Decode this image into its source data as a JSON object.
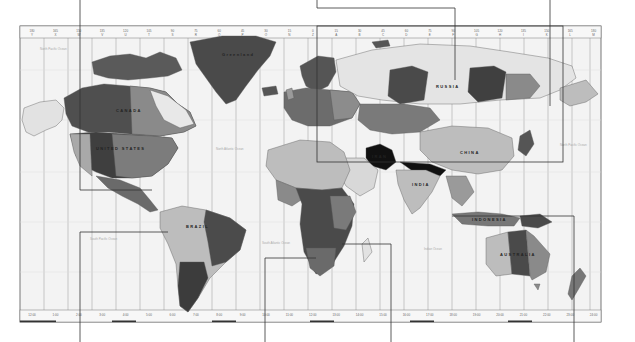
{
  "figure": {
    "colors": {
      "background": "#ffffff",
      "ocean": "#f3f3f3",
      "zone_line": "#9a9a9a",
      "frame": "#555555",
      "callout_line": "#333333",
      "land_dark": "#4a4a4a",
      "land_mid": "#8a8a8a",
      "land_light": "#bdbdbd",
      "land_pale": "#e2e2e2",
      "highlight": "#111111"
    },
    "top_ruler": {
      "longitudes": [
        "180",
        "165",
        "150",
        "135",
        "120",
        "105",
        "90",
        "75",
        "60",
        "45",
        "30",
        "15",
        "0",
        "15",
        "30",
        "45",
        "60",
        "75",
        "90",
        "105",
        "120",
        "135",
        "150",
        "165",
        "180"
      ],
      "zone_letters": [
        "Y",
        "X",
        "W",
        "V",
        "U",
        "T",
        "S",
        "R",
        "Q",
        "P",
        "O",
        "N",
        "Z",
        "A",
        "B",
        "C",
        "D",
        "E",
        "F",
        "G",
        "H",
        "I",
        "K",
        "L",
        "M"
      ]
    },
    "bottom_ruler": {
      "times": [
        "12:00",
        "1:00",
        "2:00",
        "3:00",
        "4:00",
        "5:00",
        "6:00",
        "7:00",
        "8:00",
        "9:00",
        "10:00",
        "11:00",
        "12:00",
        "13:00",
        "14:00",
        "15:00",
        "16:00",
        "17:00",
        "18:00",
        "19:00",
        "20:00",
        "21:00",
        "22:00",
        "23:00",
        "24:00"
      ]
    },
    "country_labels": {
      "greenland": "Greenland",
      "canada": "CANADA",
      "united_states": "UNITED STATES",
      "brazil": "BRAZIL",
      "russia": "RUSSIA",
      "china": "CHINA",
      "india": "INDIA",
      "iran": "IRAN",
      "australia": "AUSTRALIA",
      "indonesia": "INDONESIA"
    },
    "ocean_labels": {
      "north_pacific_w": "North Pacific Ocean",
      "north_atlantic": "North Atlantic Ocean",
      "south_pacific": "South Pacific Ocean",
      "south_atlantic": "South Atlantic Ocean",
      "indian": "Indian Ocean",
      "north_pacific_e": "North Pacific Ocean"
    },
    "callouts": {
      "top": [
        "callout-north-america",
        "callout-eurasia",
        "callout-east-asia"
      ],
      "bottom": [
        "callout-americas",
        "callout-south-atlantic",
        "callout-africa",
        "callout-oceania"
      ]
    }
  }
}
